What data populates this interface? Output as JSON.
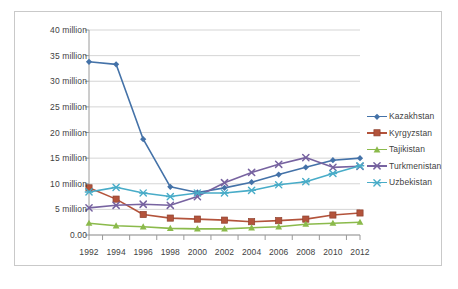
{
  "chart_data": {
    "type": "line",
    "title": "",
    "xlabel": "",
    "ylabel": "",
    "categories": [
      1992,
      1994,
      1996,
      1998,
      2000,
      2002,
      2004,
      2006,
      2008,
      2010,
      2012
    ],
    "xtick_labels": [
      "1992",
      "1994",
      "1996",
      "1998",
      "2000",
      "2002",
      "2004",
      "2006",
      "2008",
      "2010",
      "2012"
    ],
    "ytick_labels": [
      "0.00",
      "5 million",
      "10 million",
      "15 million",
      "20 million",
      "25 million",
      "30 million",
      "35 million",
      "40 million"
    ],
    "ytick_values": [
      0,
      5000000,
      10000000,
      15000000,
      20000000,
      25000000,
      30000000,
      35000000,
      40000000
    ],
    "ylim": [
      0,
      40000000
    ],
    "xlim": [
      1992,
      2012
    ],
    "grid": "horizontal",
    "legend_position": "right",
    "value_unit": "millions",
    "series": [
      {
        "name": "Kazakhstan",
        "color": "#4472a8",
        "marker": "diamond",
        "values": [
          33.8,
          33.3,
          18.7,
          9.4,
          8.3,
          9.2,
          10.3,
          11.8,
          13.2,
          14.6,
          15.0
        ]
      },
      {
        "name": "Kyrgyzstan",
        "color": "#b3533b",
        "marker": "square",
        "values": [
          9.2,
          7.0,
          4.0,
          3.3,
          3.1,
          2.9,
          2.6,
          2.8,
          3.1,
          3.9,
          4.3
        ]
      },
      {
        "name": "Tajikistan",
        "color": "#8bba4b",
        "marker": "triangle",
        "values": [
          2.3,
          1.8,
          1.6,
          1.3,
          1.2,
          1.2,
          1.4,
          1.6,
          2.1,
          2.3,
          2.5
        ]
      },
      {
        "name": "Turkmenistan",
        "color": "#7763a0",
        "marker": "x",
        "values": [
          5.3,
          5.8,
          6.0,
          5.8,
          7.5,
          10.2,
          12.2,
          13.8,
          15.1,
          13.2,
          13.4
        ]
      },
      {
        "name": "Uzbekistan",
        "color": "#48acc8",
        "marker": "asterisk",
        "values": [
          8.4,
          9.3,
          8.2,
          7.5,
          8.2,
          8.2,
          8.7,
          9.8,
          10.4,
          12.0,
          13.5
        ]
      }
    ]
  }
}
